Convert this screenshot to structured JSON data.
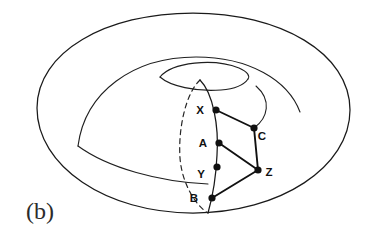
{
  "figure": {
    "panel_label": "(b)",
    "caption_text": "(b)",
    "shape_name": "torus",
    "background_color": "#ffffff",
    "line_color": "#111111"
  },
  "vertices": [
    {
      "id": "X",
      "label": "X",
      "cx": 216,
      "cy": 110,
      "label_x": 200,
      "label_y": 114,
      "r": 3.6
    },
    {
      "id": "A",
      "label": "A",
      "cx": 219,
      "cy": 143,
      "label_x": 203,
      "label_y": 147,
      "r": 3.6
    },
    {
      "id": "Y",
      "label": "Y",
      "cx": 217,
      "cy": 167,
      "label_x": 201,
      "label_y": 178,
      "r": 3.6
    },
    {
      "id": "B",
      "label": "B",
      "cx": 212,
      "cy": 198,
      "label_x": 194,
      "label_y": 202,
      "r": 3.6
    },
    {
      "id": "C",
      "label": "C",
      "cx": 254,
      "cy": 128,
      "label_x": 259,
      "label_y": 140,
      "r": 3.6
    },
    {
      "id": "Z",
      "label": "Z",
      "cx": 258,
      "cy": 170,
      "label_x": 265,
      "label_y": 176,
      "r": 3.6
    }
  ],
  "edges": [
    {
      "id": "X-C",
      "from": "X",
      "to": "C"
    },
    {
      "id": "C-Z",
      "from": "C",
      "to": "Z"
    },
    {
      "id": "A-Z",
      "from": "A",
      "to": "Z"
    },
    {
      "id": "Z-B",
      "from": "Z",
      "to": "B"
    },
    {
      "id": "X-A",
      "from": "X",
      "to": "A"
    },
    {
      "id": "A-Y",
      "from": "A",
      "to": "Y"
    },
    {
      "id": "Y-B",
      "from": "Y",
      "to": "B"
    }
  ],
  "curves": {
    "outer_outline": "M 37,108 C 37,52 106,13 193,13 C 280,13 350,53 350,110 C 350,167 280,213 193,213 C 106,213 37,166 37,108 Z",
    "inner_upper_ridge": "M 78,146 C 85,92 133,57 196,57 C 249,57 288,80 300,112",
    "inner_lower_sweep": "M 78,146 C 108,168 160,182 208,184",
    "hole_top_arc": "M 160,77 C 172,62 214,58 239,68 C 248,72 250,76 248,79",
    "hole_bottom_arc": "M 160,77 C 170,86 196,92 221,90 C 234,89 244,85 248,79",
    "right_lobe": "M 256,86 C 272,100 268,118 254,128",
    "meridian_front": "M 200,80 C 213,93 219,126 217,155 C 216,178 212,199 208,213",
    "meridian_hidden": "M 200,80 C 186,93 178,128 180,158 C 182,184 196,206 208,213"
  }
}
